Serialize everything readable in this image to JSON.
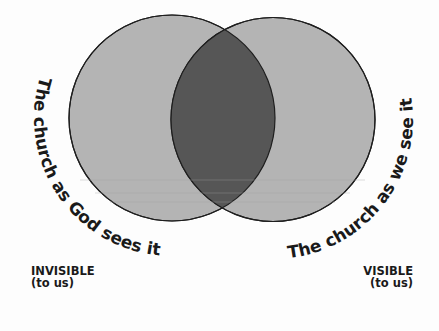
{
  "diagram": {
    "type": "venn",
    "colors": {
      "circle_fill": "#b4b4b4",
      "overlap_fill": "#565656",
      "stroke": "#1e1e1e",
      "text": "#1a1a1a"
    },
    "circles": [
      {
        "id": "left",
        "label": "The church as God sees it",
        "caption_title": "INVISIBLE",
        "caption_sub": "(to us)"
      },
      {
        "id": "right",
        "label": "The church as we see it",
        "caption_title": "VISIBLE",
        "caption_sub": "(to us)"
      }
    ]
  }
}
